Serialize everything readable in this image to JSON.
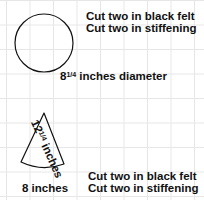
{
  "grid": {
    "color": "#e6e6e6",
    "spacing_px": 24
  },
  "circle_piece": {
    "instructions": [
      "Cut two in black felt",
      "Cut two in stiffening"
    ],
    "dimension_whole": "8",
    "dimension_fraction": "1/4",
    "dimension_suffix": " inches diameter"
  },
  "cone_piece": {
    "side_whole": "12",
    "side_fraction": "1/4",
    "side_suffix": " inches",
    "base_label": "8 inches",
    "instructions": [
      "Cut two in black felt",
      "Cut two in stiffening"
    ]
  }
}
